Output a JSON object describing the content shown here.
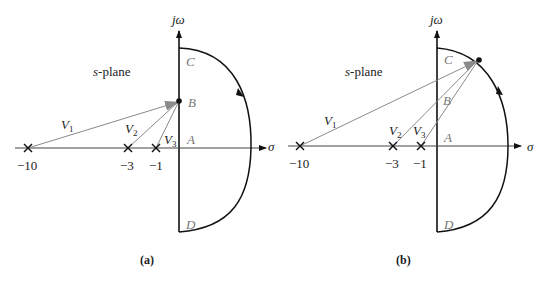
{
  "panels": [
    {
      "id": "a",
      "caption": "(a)",
      "plane_label": "s-plane",
      "axis_imag": "jω",
      "axis_real": "σ",
      "points": {
        "A": "A",
        "B": "B",
        "C": "C",
        "D": "D"
      },
      "poles": [
        "−10",
        "−3",
        "−1"
      ],
      "vectors": [
        "V",
        "V",
        "V"
      ],
      "vector_subs": [
        "1",
        "2",
        "3"
      ],
      "test_point": "B"
    },
    {
      "id": "b",
      "caption": "(b)",
      "plane_label": "s-plane",
      "axis_imag": "jω",
      "axis_real": "σ",
      "points": {
        "A": "A",
        "B": "B",
        "C": "C",
        "D": "D"
      },
      "poles": [
        "−10",
        "−3",
        "−1"
      ],
      "vectors": [
        "V",
        "V",
        "V"
      ],
      "vector_subs": [
        "1",
        "2",
        "3"
      ],
      "test_point": "on arc between C and A"
    }
  ],
  "colors": {
    "axis": "#111111",
    "vector": "#8a8a8a",
    "label": "#777777",
    "contour": "#111111"
  }
}
